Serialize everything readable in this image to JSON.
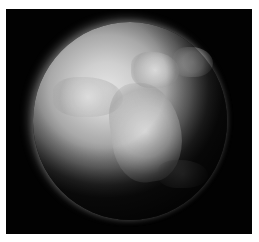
{
  "image": {
    "subject": "snow-covered planet Earth (grayscale)",
    "alt": "Grayscale render of a frozen Earth globe against a black background",
    "colors": {
      "background": "#020202",
      "border": "#ffffff",
      "planet_highlight": "#e4e4e4",
      "planet_mid": "#a9a9a9",
      "planet_shadow": "#111111"
    }
  }
}
